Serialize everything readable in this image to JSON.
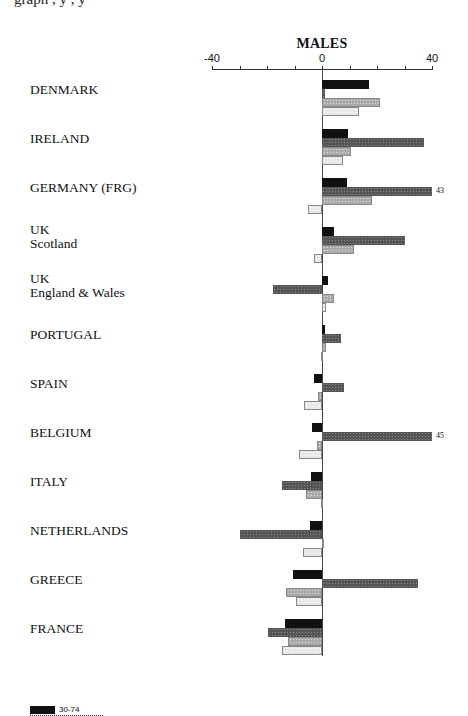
{
  "header": {
    "cut_text": "graph  ,  y  ,  y"
  },
  "chart_data": {
    "type": "bar",
    "orientation": "horizontal",
    "title": "MALES",
    "xlabel": "",
    "ylabel": "",
    "xlim": [
      -40,
      40
    ],
    "x_ticks": [
      -40,
      -30,
      -20,
      -10,
      0,
      10,
      20,
      30,
      40
    ],
    "x_tick_labels": [
      "-40",
      "0",
      "40"
    ],
    "grid": false,
    "categories": [
      "DENMARK",
      "IRELAND",
      "GERMANY (FRG)",
      "UK Scotland",
      "UK England & Wales",
      "PORTUGAL",
      "SPAIN",
      "BELGIUM",
      "ITALY",
      "NETHERLANDS",
      "GREECE",
      "FRANCE"
    ],
    "category_display": [
      [
        "DENMARK"
      ],
      [
        "IRELAND"
      ],
      [
        "GERMANY (FRG)"
      ],
      [
        "UK",
        "Scotland"
      ],
      [
        "UK",
        "England & Wales"
      ],
      [
        "PORTUGAL"
      ],
      [
        "SPAIN"
      ],
      [
        "BELGIUM"
      ],
      [
        "ITALY"
      ],
      [
        "NETHERLANDS"
      ],
      [
        "GREECE"
      ],
      [
        "FRANCE"
      ]
    ],
    "series": [
      {
        "name": "30-74",
        "style": "solid black",
        "values": [
          17,
          9.5,
          9,
          4.5,
          2,
          1,
          -3,
          -3.5,
          -4,
          -4.5,
          -10.5,
          -13.5
        ]
      },
      {
        "name": "series 2 (dark hatched)",
        "style": "dark gray hatch",
        "values": [
          1,
          37,
          43,
          30,
          -18,
          7,
          8,
          45,
          -14.5,
          -30,
          35,
          -19.5
        ]
      },
      {
        "name": "series 3 (medium hatched)",
        "style": "medium gray hatch",
        "values": [
          21,
          10.5,
          18,
          11.5,
          4.5,
          1.5,
          -1.5,
          -2,
          -6,
          0.5,
          -13,
          -12.5
        ]
      },
      {
        "name": "series 4 (light hatched)",
        "style": "light gray hatch",
        "values": [
          13.5,
          7.5,
          -5,
          -3,
          1.5,
          -0.5,
          -6.5,
          -8.5,
          -0.5,
          -7,
          -9.5,
          -14.5
        ]
      }
    ],
    "annotations": [
      {
        "category": "GERMANY (FRG)",
        "series": 1,
        "text": "43",
        "note": "bar clipped at axis max 40"
      },
      {
        "category": "BELGIUM",
        "series": 1,
        "text": "45",
        "note": "bar clipped at axis max 40"
      }
    ],
    "legend": {
      "position": "bottom-left",
      "entries": [
        {
          "label": "30-74",
          "style": "solid black"
        }
      ]
    }
  }
}
